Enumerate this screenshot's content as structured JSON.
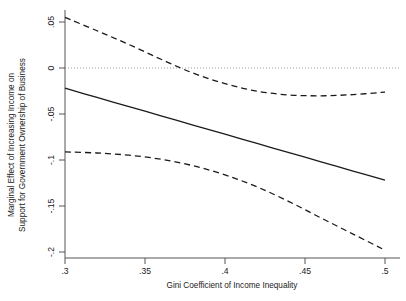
{
  "chart_data": {
    "type": "line",
    "title": "",
    "xlabel": "Gini Coefficient of Income Inequality",
    "ylabel": "Marginal Effect of Increasing Income on Support for Government Ownership of Business",
    "ylabel_line1": "Marginal Effect of Increasing Income on",
    "ylabel_line2": "Support for Government Ownership of Business",
    "xlim": [
      0.3,
      0.5
    ],
    "ylim": [
      -0.2,
      0.055
    ],
    "grid": false,
    "legend": "none",
    "xticks": [
      0.3,
      0.35,
      0.4,
      0.45,
      0.5
    ],
    "xticklabels": [
      ".3",
      ".35",
      ".4",
      ".45",
      ".5"
    ],
    "yticks": [
      0.05,
      0,
      -0.05,
      -0.1,
      -0.15,
      -0.2
    ],
    "yticklabels": [
      ".05",
      "0",
      "-.05",
      "-.1",
      "-.15",
      "-.2"
    ],
    "zero_reference_line": {
      "value": 0,
      "style": "dotted",
      "color": "#999999"
    },
    "x": [
      0.3,
      0.32,
      0.34,
      0.36,
      0.38,
      0.4,
      0.42,
      0.44,
      0.46,
      0.48,
      0.5
    ],
    "series": [
      {
        "name": "Marginal Effect",
        "style": "solid",
        "color": "#1a1a1a",
        "values": [
          -0.022,
          -0.032,
          -0.042,
          -0.052,
          -0.062,
          -0.072,
          -0.082,
          -0.092,
          -0.102,
          -0.112,
          -0.122
        ]
      },
      {
        "name": "Upper 95% Confidence Bound",
        "style": "dashed",
        "color": "#1a1a1a",
        "values": [
          0.055,
          0.0405,
          0.0255,
          0.0095,
          -0.0055,
          -0.017,
          -0.0252,
          -0.0293,
          -0.0302,
          -0.0289,
          -0.0262
        ]
      },
      {
        "name": "Lower 95% Confidence Bound",
        "style": "dashed",
        "color": "#1a1a1a",
        "values": [
          -0.0912,
          -0.0924,
          -0.0948,
          -0.0992,
          -0.1062,
          -0.1162,
          -0.1292,
          -0.1452,
          -0.163,
          -0.1805,
          -0.198
        ]
      }
    ],
    "annotations": {
      "zero_crossing_upper_ci": 0.357
    }
  },
  "axes": {
    "x_axis_label": "Gini Coefficient of Income Inequality",
    "y_axis_label_line1": "Marginal Effect of Increasing Income on",
    "y_axis_label_line2": "Support for Government Ownership of Business"
  }
}
